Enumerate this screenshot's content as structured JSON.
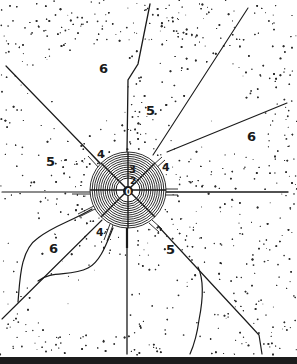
{
  "figure": {
    "type": "concentric zone diagram",
    "background_color": "#ffffff",
    "ink_color": "#1a1a1a",
    "center": {
      "x": 128,
      "y": 190
    },
    "rings": {
      "outer_radius": 38,
      "inner_radius": 12,
      "count": 12
    }
  },
  "labels": {
    "zone_0": "0",
    "zone_2": "2",
    "zone_3": "3",
    "zone_4_upper_left": "4",
    "zone_4_upper_right": "4",
    "zone_4_lower_left": "4",
    "zone_5_top": "5",
    "zone_5_left": "5",
    "zone_5_lower_right": "5",
    "zone_6_top_left": "6",
    "zone_6_right": "6",
    "zone_6_lower_left": "6"
  },
  "zones": [
    {
      "id": "0",
      "description": "central core"
    },
    {
      "id": "2",
      "description": "inner ring"
    },
    {
      "id": "3",
      "description": "banded ring"
    },
    {
      "id": "4",
      "description": "radial corridor ends adjacent to core"
    },
    {
      "id": "5",
      "description": "densely stippled sectors"
    },
    {
      "id": "6",
      "description": "open, lightly stippled sectors"
    }
  ]
}
